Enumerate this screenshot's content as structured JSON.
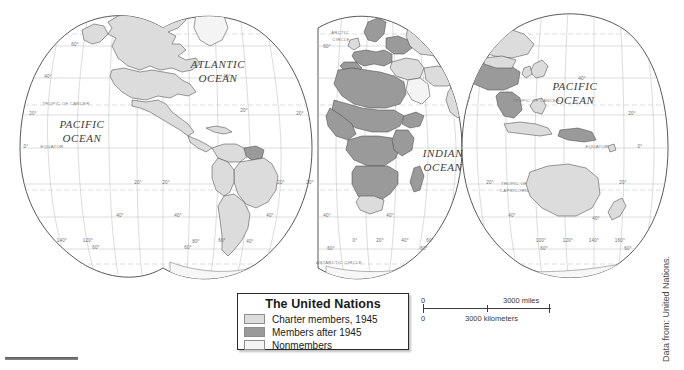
{
  "figure": {
    "projection": "goode-homolosine-interrupted",
    "theme": "world-map-united-nations-membership"
  },
  "legend": {
    "title": "The United Nations",
    "items": [
      {
        "label": "Charter members, 1945",
        "color": "#dcdcdc",
        "key": "charter-members"
      },
      {
        "label": "Members after 1945",
        "color": "#9a9a9a",
        "key": "members-after"
      },
      {
        "label": "Nonmembers",
        "color": "#f4f4f4",
        "key": "nonmembers"
      }
    ]
  },
  "scale": {
    "miles_zero": "0",
    "miles_max": "3000 miles",
    "km_zero": "0",
    "km_max": "3000 kilometers"
  },
  "credit": {
    "text": "Data from: United Nations."
  },
  "ocean_labels": [
    {
      "id": "pacific-west",
      "lines": [
        "PACIFIC",
        "OCEAN"
      ],
      "x": 82,
      "y": 128
    },
    {
      "id": "atlantic",
      "lines": [
        "ATLANTIC",
        "OCEAN"
      ],
      "x": 218,
      "y": 68
    },
    {
      "id": "indian",
      "lines": [
        "INDIAN",
        "OCEAN"
      ],
      "x": 443,
      "y": 157
    },
    {
      "id": "pacific-east",
      "lines": [
        "PACIFIC",
        "OCEAN"
      ],
      "x": 575,
      "y": 90
    }
  ],
  "special_lines": [
    {
      "id": "arctic-circle-1",
      "text": "ARCTIC",
      "x": 340,
      "y": 34
    },
    {
      "id": "arctic-circle-2",
      "text": "CIRCLE",
      "x": 341,
      "y": 41
    },
    {
      "id": "tropic-cancer-1",
      "text": "TROPIC OF CANCER",
      "x": 66,
      "y": 105
    },
    {
      "id": "tropic-cancer-2",
      "text": "TROPIC OF CANCER",
      "x": 536,
      "y": 102
    },
    {
      "id": "tropic-capricorn-1",
      "text": "TROPIC OF",
      "x": 514,
      "y": 185
    },
    {
      "id": "tropic-capricorn-2",
      "text": "CAPRICORN",
      "x": 514,
      "y": 192
    },
    {
      "id": "equator-west",
      "text": "EQUATOR",
      "x": 52,
      "y": 148
    },
    {
      "id": "equator-east",
      "text": "EQUATOR",
      "x": 597,
      "y": 148
    },
    {
      "id": "antarctic-circle",
      "text": "ANTARCTIC CIRCLE",
      "x": 339,
      "y": 264
    }
  ],
  "graticule_labels": [
    {
      "id": "lat-60n-left",
      "text": "60°",
      "x": 75,
      "y": 46
    },
    {
      "id": "lat-40n-left",
      "text": "40°",
      "x": 48,
      "y": 78
    },
    {
      "id": "lat-40n-mid",
      "text": "40°",
      "x": 227,
      "y": 78
    },
    {
      "id": "lat-20n-left",
      "text": "20°",
      "x": 33,
      "y": 115
    },
    {
      "id": "lat-20n-mid",
      "text": "20°",
      "x": 244,
      "y": 112
    },
    {
      "id": "lat-0-left",
      "text": "0°",
      "x": 26,
      "y": 148
    },
    {
      "id": "lat-20s-left",
      "text": "20°",
      "x": 138,
      "y": 184
    },
    {
      "id": "lat-20s-mid",
      "text": "20°",
      "x": 166,
      "y": 184
    },
    {
      "id": "lat-20s-mid2",
      "text": "20°",
      "x": 281,
      "y": 184
    },
    {
      "id": "lat-20s-right",
      "text": "20°",
      "x": 310,
      "y": 184
    },
    {
      "id": "lat-40s-left",
      "text": "40°",
      "x": 120,
      "y": 217
    },
    {
      "id": "lat-40s-mid",
      "text": "40°",
      "x": 178,
      "y": 217
    },
    {
      "id": "lat-40s-mid2",
      "text": "40°",
      "x": 270,
      "y": 217
    },
    {
      "id": "lat-60s-left",
      "text": "60°",
      "x": 96,
      "y": 249
    },
    {
      "id": "lat-60s-mid",
      "text": "60°",
      "x": 188,
      "y": 249
    },
    {
      "id": "lon-140w",
      "text": "140°",
      "x": 62,
      "y": 242
    },
    {
      "id": "lon-120w",
      "text": "120°",
      "x": 88,
      "y": 242
    },
    {
      "id": "lon-80w",
      "text": "80°",
      "x": 196,
      "y": 243
    },
    {
      "id": "lon-60w",
      "text": "60°",
      "x": 222,
      "y": 242
    },
    {
      "id": "lon-40w",
      "text": "40°",
      "x": 250,
      "y": 243
    },
    {
      "id": "lat-60n-mid",
      "text": "60°",
      "x": 327,
      "y": 48
    },
    {
      "id": "lat-20n-mid3",
      "text": "20°",
      "x": 300,
      "y": 115
    },
    {
      "id": "lat-40s-mid3",
      "text": "40°",
      "x": 327,
      "y": 217
    },
    {
      "id": "lat-40s-mid4",
      "text": "40°",
      "x": 390,
      "y": 217
    },
    {
      "id": "lat-40s-right",
      "text": "40°",
      "x": 512,
      "y": 217
    },
    {
      "id": "lat-60s-mid2",
      "text": "60°",
      "x": 331,
      "y": 250
    },
    {
      "id": "lat-60s-right",
      "text": "60°",
      "x": 424,
      "y": 250
    },
    {
      "id": "lon-0",
      "text": "0°",
      "x": 355,
      "y": 242
    },
    {
      "id": "lon-20e",
      "text": "20°",
      "x": 380,
      "y": 242
    },
    {
      "id": "lon-40e",
      "text": "40°",
      "x": 405,
      "y": 242
    },
    {
      "id": "lon-60e",
      "text": "60°",
      "x": 430,
      "y": 242
    },
    {
      "id": "lat-40n-right",
      "text": "40°",
      "x": 582,
      "y": 80
    },
    {
      "id": "lat-20n-right",
      "text": "20°",
      "x": 632,
      "y": 115
    },
    {
      "id": "lat-0-right",
      "text": "0°",
      "x": 640,
      "y": 148
    },
    {
      "id": "lat-20s-right2",
      "text": "20°",
      "x": 623,
      "y": 184
    },
    {
      "id": "lat-40s-right2",
      "text": "40°",
      "x": 596,
      "y": 220
    },
    {
      "id": "lat-60s-right2",
      "text": "60°",
      "x": 544,
      "y": 250
    },
    {
      "id": "lat-60s-right3",
      "text": "60°",
      "x": 628,
      "y": 250
    },
    {
      "id": "lon-100e",
      "text": "100°",
      "x": 541,
      "y": 242
    },
    {
      "id": "lon-120e",
      "text": "120°",
      "x": 568,
      "y": 242
    },
    {
      "id": "lon-140e",
      "text": "140°",
      "x": 594,
      "y": 242
    },
    {
      "id": "lon-160e",
      "text": "160°",
      "x": 620,
      "y": 242
    },
    {
      "id": "lat-20n-mid4",
      "text": "20°",
      "x": 490,
      "y": 184
    }
  ]
}
